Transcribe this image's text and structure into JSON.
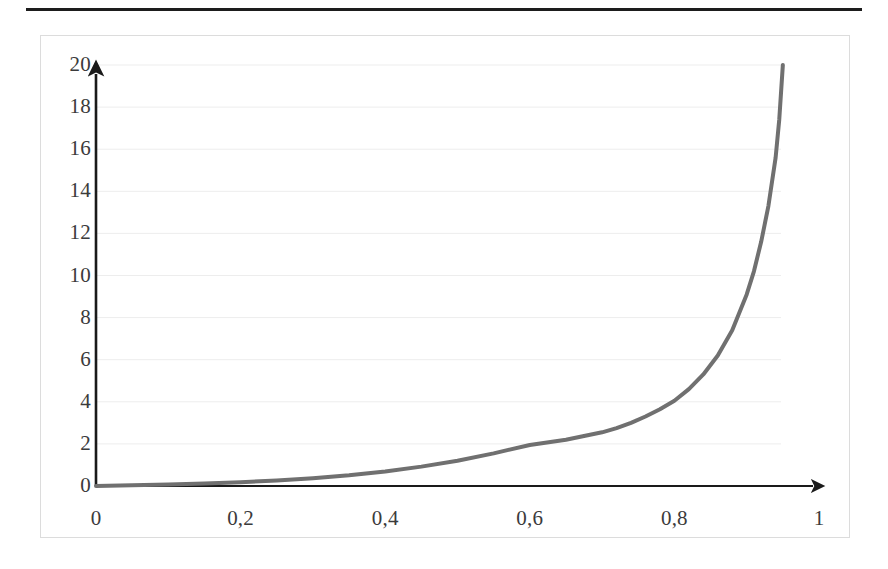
{
  "page": {
    "background_color": "#ffffff",
    "rule_color": "#1d1d1d",
    "frame_border_color": "#dcdcdc"
  },
  "chart_data": {
    "type": "line",
    "title": "",
    "subtitle": "",
    "xlabel": "",
    "ylabel": "",
    "xlim": [
      0,
      1
    ],
    "ylim": [
      0,
      20
    ],
    "grid": true,
    "grid_color": "#ededed",
    "legend": "none",
    "axis_style": "arrow",
    "axis_color": "#1a1a1a",
    "line_color": "#707070",
    "line_width": 4,
    "decimal_separator": ",",
    "x_ticks": [
      0,
      0.2,
      0.4,
      0.6,
      0.8,
      1
    ],
    "x_tick_labels": [
      "0",
      "0,2",
      "0,4",
      "0,6",
      "0,8",
      "1"
    ],
    "y_ticks": [
      0,
      2,
      4,
      6,
      8,
      10,
      12,
      14,
      16,
      18,
      20
    ],
    "y_tick_labels": [
      "0",
      "2",
      "4",
      "6",
      "8",
      "10",
      "12",
      "14",
      "16",
      "18",
      "20"
    ],
    "series": [
      {
        "name": "curve",
        "x": [
          0.0,
          0.05,
          0.1,
          0.15,
          0.2,
          0.25,
          0.3,
          0.35,
          0.4,
          0.45,
          0.5,
          0.55,
          0.6,
          0.65,
          0.7,
          0.72,
          0.74,
          0.76,
          0.78,
          0.8,
          0.82,
          0.84,
          0.86,
          0.88,
          0.9,
          0.91,
          0.92,
          0.93,
          0.94,
          0.945,
          0.95
        ],
        "y": [
          0.0,
          0.03,
          0.07,
          0.12,
          0.18,
          0.26,
          0.37,
          0.51,
          0.69,
          0.92,
          1.2,
          1.55,
          1.95,
          2.2,
          2.55,
          2.75,
          3.0,
          3.3,
          3.65,
          4.05,
          4.6,
          5.3,
          6.2,
          7.4,
          9.1,
          10.2,
          11.6,
          13.3,
          15.6,
          17.4,
          20.0
        ]
      }
    ]
  }
}
